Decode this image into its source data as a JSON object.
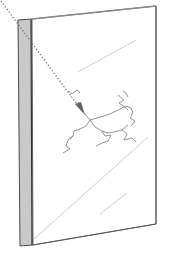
{
  "diagram": {
    "title": "",
    "colors": {
      "background": "#ffffff",
      "outline": "#555555",
      "side_face": "#c8c8c8",
      "side_face_dark": "#9a9a9a",
      "arrow": "#7a7a7a",
      "crack": "#6e6e6e",
      "reflection": "#c4c4c4"
    },
    "elements": {
      "pane": "glass-pane",
      "edge": "pane-edge-side",
      "impact_arrow": "dotted-impact-arrow",
      "crack": "crack-pattern",
      "reflections": "glare-lines"
    }
  }
}
